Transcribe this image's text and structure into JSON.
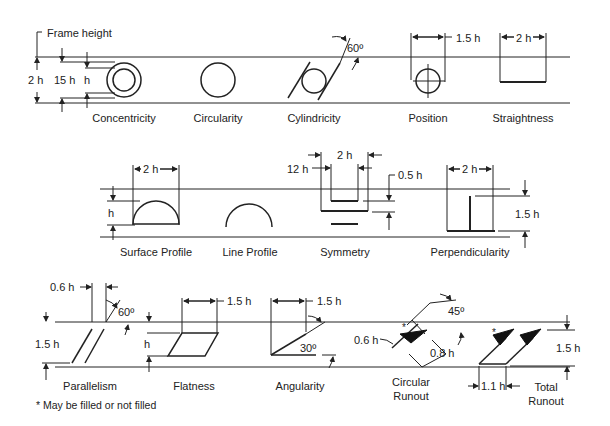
{
  "row1": {
    "frame_height_label": "Frame height",
    "dims": {
      "two_h": "2 h",
      "fifteen_h": "15 h",
      "h": "h",
      "cyl_angle": "60º",
      "pos_width": "1.5 h",
      "str_width": "2 h"
    },
    "captions": [
      "Concentricity",
      "Circularity",
      "Cylindricity",
      "Position",
      "Straightness"
    ]
  },
  "row2": {
    "dims": {
      "surf_width": "2 h",
      "surf_h": "h",
      "sym_outer": "12 h",
      "sym_inner": "2 h",
      "sym_gap": "0.5 h",
      "perp_width": "2 h",
      "perp_height": "1.5 h"
    },
    "captions": [
      "Surface Profile",
      "Line Profile",
      "Symmetry",
      "Perpendicularity"
    ]
  },
  "row3": {
    "dims": {
      "par_spacing": "0.6 h",
      "par_angle": "60º",
      "par_height": "1.5 h",
      "flat_width": "1.5 h",
      "flat_h": "h",
      "ang_width": "1.5 h",
      "ang_angle": "30º",
      "cr_width": "0.6 h",
      "cr_angle": "45º",
      "cr_len": "0.8 h",
      "tr_spacing": "1.1 h",
      "tr_height": "1.5 h"
    },
    "captions": [
      "Parallelism",
      "Flatness",
      "Angularity",
      "Circular Runout",
      "Total Runout"
    ],
    "caption_circular_1": "Circular",
    "caption_circular_2": "Runout",
    "caption_total_1": "Total",
    "caption_total_2": "Runout"
  },
  "footnote": "* May be filled or not filled"
}
